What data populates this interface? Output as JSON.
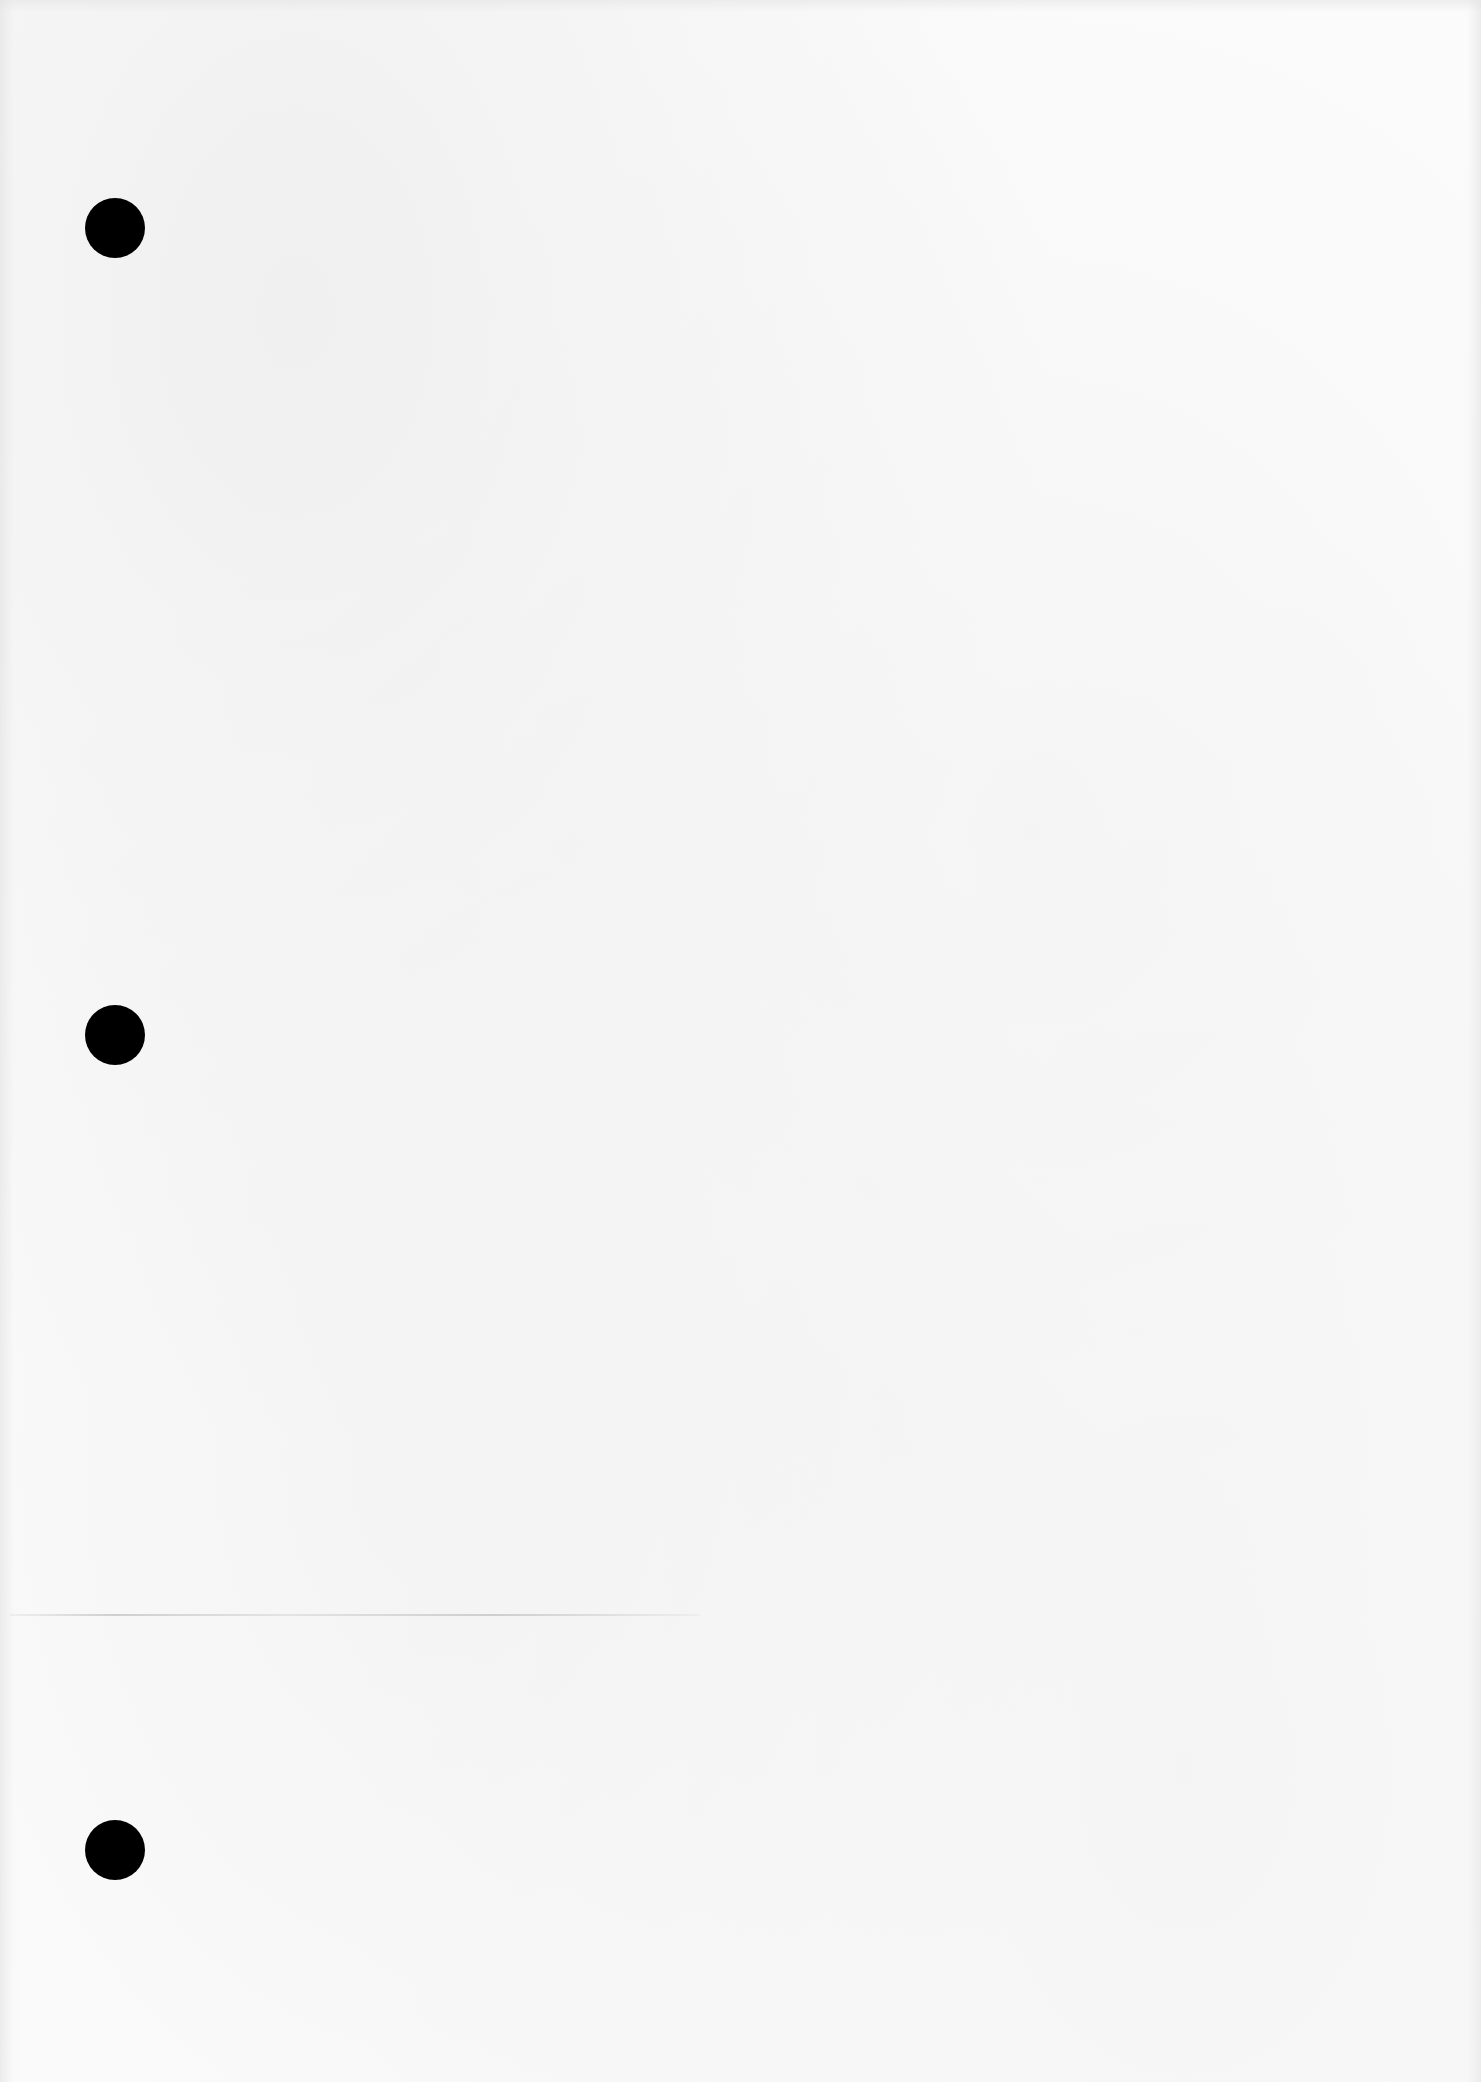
{
  "document": {
    "type": "blank-scanned-page",
    "background_color": "#fbfbfb",
    "text_content": "",
    "punch_holes": [
      {
        "x": 85,
        "y": 198,
        "diameter": 60,
        "color": "#000000"
      },
      {
        "x": 85,
        "y": 1005,
        "diameter": 60,
        "color": "#000000"
      },
      {
        "x": 85,
        "y": 1820,
        "diameter": 60,
        "color": "#000000"
      }
    ],
    "artifacts": [
      {
        "kind": "faint-horizontal-line",
        "x": 10,
        "y": 1614,
        "width": 690
      }
    ]
  }
}
